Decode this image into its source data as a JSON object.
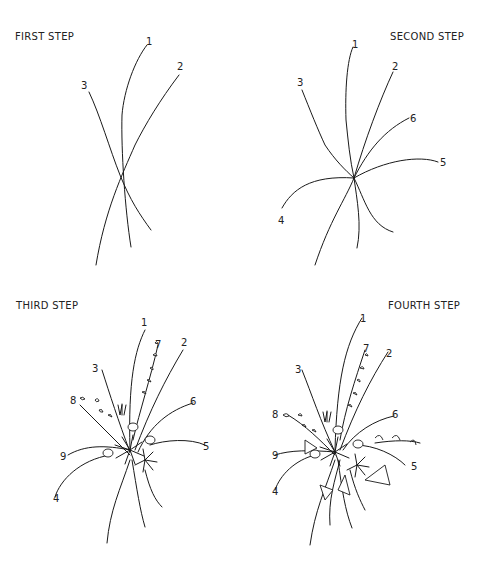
{
  "panels": [
    {
      "title": "FIRST STEP",
      "labels": [
        "1",
        "2",
        "3"
      ]
    },
    {
      "title": "SECOND STEP",
      "labels": [
        "1",
        "2",
        "3",
        "4",
        "5",
        "6"
      ]
    },
    {
      "title": "THIRD STEP",
      "labels": [
        "1",
        "2",
        "3",
        "4",
        "5",
        "6",
        "7",
        "8",
        "9"
      ]
    },
    {
      "title": "FOURTH STEP",
      "labels": [
        "1",
        "2",
        "3",
        "4",
        "5",
        "6",
        "7",
        "8",
        "9"
      ]
    }
  ],
  "colors": {
    "line": "#1a1a1a",
    "background": "#ffffff"
  }
}
